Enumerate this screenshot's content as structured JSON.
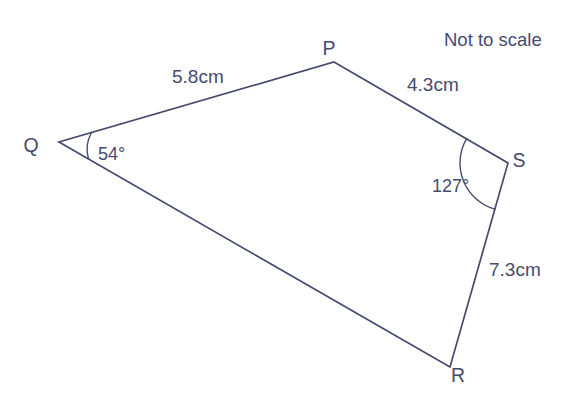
{
  "figure": {
    "title_note": "Not to scale",
    "shape_name": "quadrilateral-pqrs",
    "stroke_color": "#464b6e",
    "background_color": "#ffffff",
    "vertices": [
      {
        "name": "P",
        "label": "P",
        "x": 334,
        "y": 62
      },
      {
        "name": "Q",
        "label": "Q",
        "x": 59,
        "y": 142
      },
      {
        "name": "R",
        "label": "R",
        "x": 450,
        "y": 367
      },
      {
        "name": "S",
        "label": "S",
        "x": 508,
        "y": 163
      }
    ],
    "vertex_label_positions": [
      {
        "name": "P",
        "x": 329,
        "y": 55
      },
      {
        "name": "Q",
        "x": 31,
        "y": 152
      },
      {
        "name": "R",
        "x": 458,
        "y": 382
      },
      {
        "name": "S",
        "x": 519,
        "y": 167
      }
    ],
    "sides": [
      {
        "name": "QP",
        "label": "5.8cm",
        "x": 172,
        "y": 83
      },
      {
        "name": "PS",
        "label": "4.3cm",
        "x": 407,
        "y": 91
      },
      {
        "name": "SR",
        "label": "7.3cm",
        "x": 489,
        "y": 276
      },
      {
        "name": "RQ",
        "label": "",
        "x": 0,
        "y": 0
      }
    ],
    "angles": [
      {
        "name": "angle-Q",
        "vertex": "Q",
        "label": "54°",
        "value": 54,
        "label_x": 98,
        "label_y": 160
      },
      {
        "name": "angle-S",
        "vertex": "S",
        "label": "127°",
        "value": 127,
        "label_x": 432,
        "label_y": 192
      }
    ],
    "note_position": {
      "x": 444,
      "y": 46
    }
  }
}
